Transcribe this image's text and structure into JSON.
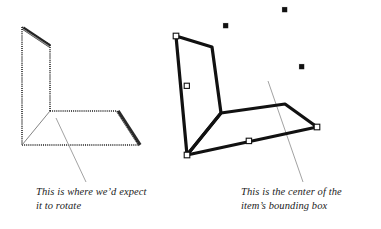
{
  "figure": {
    "background_color": "#ffffff",
    "ink_color": "#111111",
    "hairline_color": "#8a8a8a",
    "handle_fill": "#ffffff",
    "handle_stroke": "#111111",
    "dot_fill": "#111111",
    "width": 381,
    "height": 229
  },
  "left_object": {
    "name": "unselected-bent-plane",
    "style": "stippled-outline-with-shaded-edges",
    "description": "L-shaped bent plane shown in perspective, outline drawn as a dotted/stippled rule with thick shaded highlight edges",
    "vertices": {
      "back_top_left": [
        22,
        27
      ],
      "back_top_right": [
        50,
        45
      ],
      "fold_right": [
        50,
        111
      ],
      "fold_left": [
        22,
        145
      ],
      "floor_right_far": [
        117,
        111
      ],
      "floor_right_near": [
        139,
        145
      ]
    },
    "fold_line": {
      "from": [
        50,
        111
      ],
      "to": [
        22,
        145
      ]
    },
    "rotation_point": [
      50,
      111
    ],
    "leader_line": {
      "from": [
        56,
        118
      ],
      "to": [
        86,
        182
      ]
    }
  },
  "right_object": {
    "name": "selected-bent-plane",
    "style": "solid-outline-with-selection-handles",
    "description": "Same L-shaped bent plane, rotated, shown selected with white square knots on its path and black square handles of its bounding box",
    "vertices": {
      "back_top_left": [
        176,
        36
      ],
      "back_top_right": [
        212,
        47
      ],
      "fold_right": [
        221,
        113
      ],
      "fold_left": [
        187,
        155
      ],
      "floor_right_far": [
        285,
        104
      ],
      "floor_right_near": [
        317,
        127
      ]
    },
    "fold_line": {
      "from": [
        221,
        113
      ],
      "to": [
        187,
        155
      ]
    },
    "path_knots": [
      [
        176,
        36
      ],
      [
        187,
        86
      ],
      [
        187,
        155
      ],
      [
        249,
        141
      ],
      [
        317,
        127
      ],
      [
        285,
        104
      ],
      [
        221,
        113
      ]
    ],
    "bounding_box_handles": [
      [
        226,
        26
      ],
      [
        285,
        10
      ],
      [
        302,
        67
      ]
    ],
    "bounding_box_center": [
      283,
      133
    ],
    "leader_line": {
      "from": [
        268,
        81
      ],
      "to": [
        303,
        182
      ]
    }
  },
  "captions": {
    "left": {
      "line1": "This is where we’d expect",
      "line2": "it to rotate",
      "text": "This is where we’d expect\nit to rotate"
    },
    "right": {
      "line1": "This is the center of the",
      "line2": "item’s bounding box",
      "text": "This is the center of the\nitem’s bounding box"
    }
  }
}
